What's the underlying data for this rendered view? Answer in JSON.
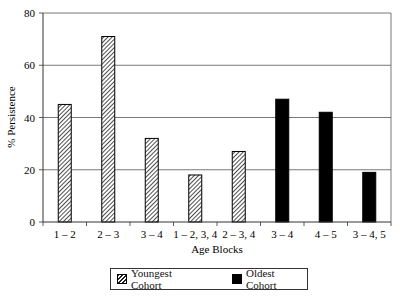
{
  "chart_data": {
    "type": "bar",
    "title": "",
    "xlabel": "Age Blocks",
    "ylabel": "% Persistence",
    "ylim": [
      0,
      80
    ],
    "yticks": [
      0,
      20,
      40,
      60,
      80
    ],
    "grid": true,
    "legend_position": "bottom",
    "categories": [
      "1 – 2",
      "2 – 3",
      "3 – 4",
      "1 – 2, 3, 4",
      "2 – 3, 4",
      "3 – 4",
      "4 – 5",
      "3 – 4, 5"
    ],
    "series": [
      {
        "name": "Youngest Cohort",
        "pattern": "hatched",
        "values": [
          45,
          71,
          32,
          18,
          27,
          null,
          null,
          null
        ]
      },
      {
        "name": "Oldest Cohort",
        "pattern": "solid",
        "color": "#000000",
        "values": [
          null,
          null,
          null,
          null,
          null,
          47,
          42,
          19
        ]
      }
    ]
  },
  "legend": {
    "youngest": "Youngest Cohort",
    "oldest": "Oldest Cohort"
  }
}
